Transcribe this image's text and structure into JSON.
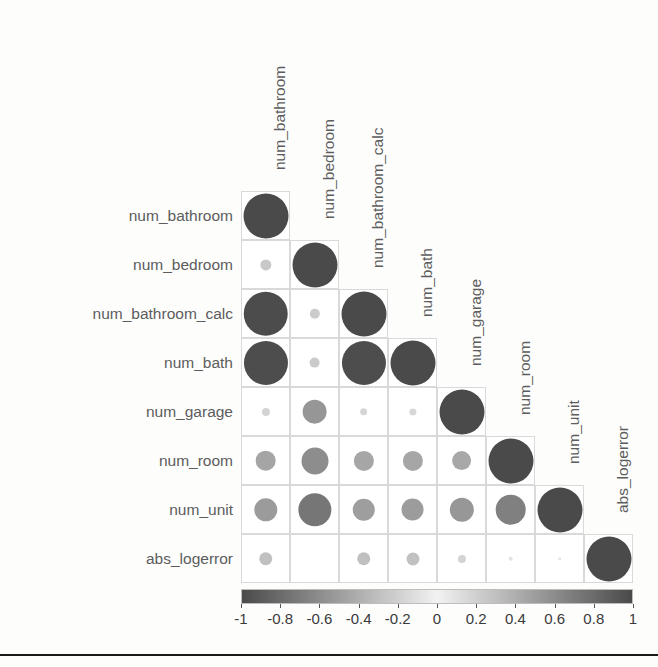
{
  "figure": {
    "type": "correlation-matrix",
    "style": "corrplot-circle-lower-triangle",
    "background_color": "#fdfdfc",
    "grid_line_color": "#d9d9d9",
    "label_color": "#5c5c5c",
    "tick_label_color": "#3a3a3a"
  },
  "variables": [
    "num_bathroom",
    "num_bedroom",
    "num_bathroom_calc",
    "num_bath",
    "num_garage",
    "num_room",
    "num_unit",
    "abs_logerror"
  ],
  "row_labels": [
    "num_bathroom",
    "num_bedroom",
    "num_bathroom_calc",
    "num_bath",
    "num_garage",
    "num_room",
    "num_unit",
    "abs_logerror"
  ],
  "column_labels": [
    "num_bathroom",
    "num_bedroom",
    "num_bathroom_calc",
    "num_bath",
    "num_garage",
    "num_room",
    "num_unit",
    "abs_logerror"
  ],
  "colorbar": {
    "orientation": "horizontal",
    "min": -1,
    "max": 1,
    "tick_labels": [
      "-1",
      "-0.8",
      "-0.6",
      "-0.4",
      "-0.2",
      "0",
      "0.2",
      "0.4",
      "0.6",
      "0.8",
      "1"
    ],
    "tick_values": [
      -1,
      -0.8,
      -0.6,
      -0.4,
      -0.2,
      0,
      0.2,
      0.4,
      0.6,
      0.8,
      1
    ],
    "colormap": "grayscale-diverging",
    "color_at_min": "#4a4a4a",
    "color_at_zero": "#f2f2f2",
    "color_at_max": "#4a4a4a"
  },
  "chart_data": {
    "type": "heatmap",
    "title": "",
    "xlabel": "",
    "ylabel": "",
    "variables": [
      "num_bathroom",
      "num_bedroom",
      "num_bathroom_calc",
      "num_bath",
      "num_garage",
      "num_room",
      "num_unit",
      "abs_logerror"
    ],
    "triangle": "lower",
    "zlim": [
      -1,
      1
    ],
    "grid": true,
    "legend_position": "bottom",
    "matrix": [
      [
        1.0,
        null,
        null,
        null,
        null,
        null,
        null,
        null
      ],
      [
        0.25,
        1.0,
        null,
        null,
        null,
        null,
        null,
        null
      ],
      [
        0.99,
        0.23,
        1.0,
        null,
        null,
        null,
        null,
        null
      ],
      [
        0.98,
        0.24,
        0.98,
        1.0,
        null,
        null,
        null,
        null
      ],
      [
        0.18,
        0.55,
        0.17,
        0.16,
        1.0,
        null,
        null,
        null
      ],
      [
        0.46,
        0.6,
        0.45,
        0.45,
        0.44,
        1.0,
        null,
        null
      ],
      [
        0.52,
        0.74,
        0.5,
        0.51,
        0.54,
        0.68,
        1.0,
        null
      ],
      [
        0.3,
        0.02,
        0.3,
        0.29,
        0.18,
        0.1,
        0.08,
        1.0
      ]
    ],
    "cells": [
      {
        "row": "num_bathroom",
        "col": "num_bathroom",
        "value": 1.0
      },
      {
        "row": "num_bedroom",
        "col": "num_bathroom",
        "value": 0.25
      },
      {
        "row": "num_bedroom",
        "col": "num_bedroom",
        "value": 1.0
      },
      {
        "row": "num_bathroom_calc",
        "col": "num_bathroom",
        "value": 0.99
      },
      {
        "row": "num_bathroom_calc",
        "col": "num_bedroom",
        "value": 0.23
      },
      {
        "row": "num_bathroom_calc",
        "col": "num_bathroom_calc",
        "value": 1.0
      },
      {
        "row": "num_bath",
        "col": "num_bathroom",
        "value": 0.98
      },
      {
        "row": "num_bath",
        "col": "num_bedroom",
        "value": 0.24
      },
      {
        "row": "num_bath",
        "col": "num_bathroom_calc",
        "value": 0.98
      },
      {
        "row": "num_bath",
        "col": "num_bath",
        "value": 1.0
      },
      {
        "row": "num_garage",
        "col": "num_bathroom",
        "value": 0.18
      },
      {
        "row": "num_garage",
        "col": "num_bedroom",
        "value": 0.55
      },
      {
        "row": "num_garage",
        "col": "num_bathroom_calc",
        "value": 0.17
      },
      {
        "row": "num_garage",
        "col": "num_bath",
        "value": 0.16
      },
      {
        "row": "num_garage",
        "col": "num_garage",
        "value": 1.0
      },
      {
        "row": "num_room",
        "col": "num_bathroom",
        "value": 0.46
      },
      {
        "row": "num_room",
        "col": "num_bedroom",
        "value": 0.6
      },
      {
        "row": "num_room",
        "col": "num_bathroom_calc",
        "value": 0.45
      },
      {
        "row": "num_room",
        "col": "num_bath",
        "value": 0.45
      },
      {
        "row": "num_room",
        "col": "num_garage",
        "value": 0.44
      },
      {
        "row": "num_room",
        "col": "num_room",
        "value": 1.0
      },
      {
        "row": "num_unit",
        "col": "num_bathroom",
        "value": 0.52
      },
      {
        "row": "num_unit",
        "col": "num_bedroom",
        "value": 0.74
      },
      {
        "row": "num_unit",
        "col": "num_bathroom_calc",
        "value": 0.5
      },
      {
        "row": "num_unit",
        "col": "num_bath",
        "value": 0.51
      },
      {
        "row": "num_unit",
        "col": "num_garage",
        "value": 0.54
      },
      {
        "row": "num_unit",
        "col": "num_room",
        "value": 0.68
      },
      {
        "row": "num_unit",
        "col": "num_unit",
        "value": 1.0
      },
      {
        "row": "abs_logerror",
        "col": "num_bathroom",
        "value": 0.3
      },
      {
        "row": "abs_logerror",
        "col": "num_bedroom",
        "value": 0.02
      },
      {
        "row": "abs_logerror",
        "col": "num_bathroom_calc",
        "value": 0.3
      },
      {
        "row": "abs_logerror",
        "col": "num_bath",
        "value": 0.29
      },
      {
        "row": "abs_logerror",
        "col": "num_garage",
        "value": 0.18
      },
      {
        "row": "abs_logerror",
        "col": "num_room",
        "value": 0.1
      },
      {
        "row": "abs_logerror",
        "col": "num_unit",
        "value": 0.08
      },
      {
        "row": "abs_logerror",
        "col": "abs_logerror",
        "value": 1.0
      }
    ]
  },
  "geometry": {
    "grid_left": 241,
    "grid_top": 191,
    "cell_size": 49,
    "n": 8,
    "colorbar_left": 241,
    "colorbar_top": 589,
    "colorbar_width": 392,
    "colorbar_height": 15,
    "bottom_rule_y": 654
  }
}
